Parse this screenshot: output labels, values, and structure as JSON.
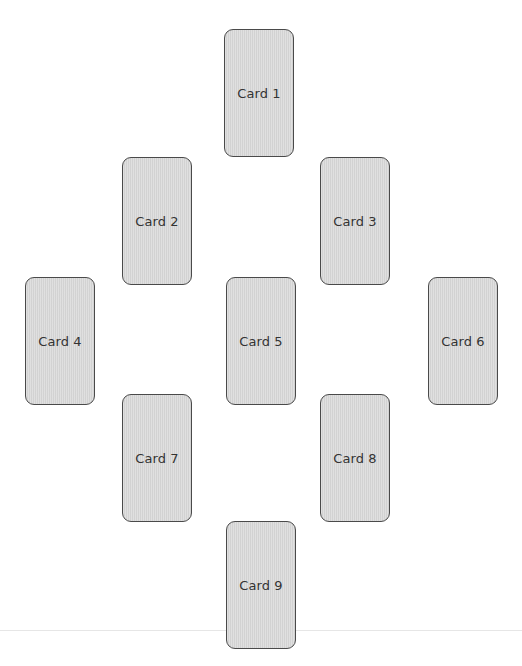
{
  "spread": {
    "cards": [
      {
        "label": "Card 1"
      },
      {
        "label": "Card 2"
      },
      {
        "label": "Card 3"
      },
      {
        "label": "Card 4"
      },
      {
        "label": "Card 5"
      },
      {
        "label": "Card 6"
      },
      {
        "label": "Card 7"
      },
      {
        "label": "Card 8"
      },
      {
        "label": "Card 9"
      }
    ]
  },
  "colors": {
    "card_fill": "#d9d9d9",
    "card_border": "#4a4a4a",
    "text": "#333333"
  }
}
